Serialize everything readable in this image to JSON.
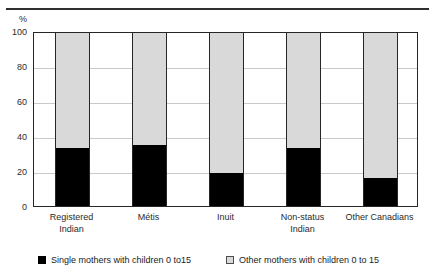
{
  "title": {
    "text": "",
    "cut_off": true
  },
  "axis": {
    "y_unit": "%",
    "y_ticks": [
      100,
      80,
      60,
      40,
      20,
      0
    ]
  },
  "legend": {
    "items": [
      {
        "label": "Single mothers with children 0 to15",
        "swatch": "black-square-icon",
        "color": "#000000"
      },
      {
        "label": "Other mothers with children 0 to 15",
        "swatch": "gray-square-icon",
        "color": "#d9d9d9"
      }
    ]
  },
  "chart_data": {
    "type": "bar",
    "stacked": true,
    "title": "",
    "xlabel": "",
    "ylabel": "%",
    "ylim": [
      0,
      100
    ],
    "yticks": [
      0,
      20,
      40,
      60,
      80,
      100
    ],
    "grid": true,
    "legend_position": "bottom",
    "categories": [
      "Registered Indian",
      "Métis",
      "Inuit",
      "Non-status Indian",
      "Other Canadians"
    ],
    "category_lines": [
      [
        "Registered",
        "Indian"
      ],
      [
        "Métis"
      ],
      [
        "Inuit"
      ],
      [
        "Non-status",
        "Indian"
      ],
      [
        "Other Canadians"
      ]
    ],
    "series": [
      {
        "name": "Single mothers with children 0 to15",
        "color": "#000000",
        "values": [
          33,
          35,
          19,
          33,
          16
        ]
      },
      {
        "name": "Other mothers with children 0 to 15",
        "color": "#d9d9d9",
        "values": [
          67,
          65,
          81,
          67,
          84
        ]
      }
    ]
  }
}
